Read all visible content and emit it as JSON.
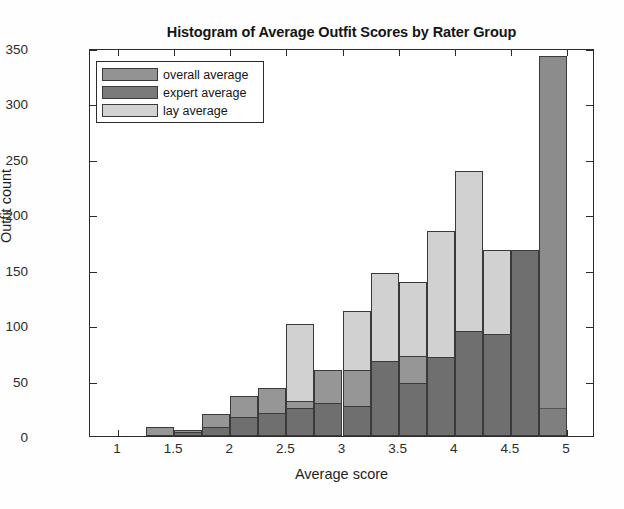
{
  "chart_data": {
    "type": "bar",
    "title": "Histogram of Average Outfit Scores by Rater Group",
    "xlabel": "Average score",
    "ylabel": "Outfit count",
    "xlim": [
      0.75,
      5.25
    ],
    "ylim": [
      0,
      350
    ],
    "ytick_labels": [
      "0",
      "50",
      "100",
      "150",
      "200",
      "250",
      "300",
      "350"
    ],
    "ytick_values": [
      0,
      50,
      100,
      150,
      200,
      250,
      300,
      350
    ],
    "xtick_labels": [
      "1",
      "1.5",
      "2",
      "2.5",
      "3",
      "3.5",
      "4",
      "4.5",
      "5"
    ],
    "xtick_values": [
      1,
      1.5,
      2,
      2.5,
      3,
      3.5,
      4,
      4.5,
      5
    ],
    "grid": false,
    "bin_width": 0.25,
    "bin_centers": [
      1.125,
      1.375,
      1.625,
      1.875,
      2.125,
      2.375,
      2.625,
      2.875,
      3.125,
      3.375,
      3.625,
      3.875,
      4.125,
      4.375,
      4.625,
      4.875
    ],
    "legend_position": "top-left",
    "series": [
      {
        "name": "overall average",
        "color": "#808080",
        "values": [
          0,
          8,
          5,
          20,
          36,
          43,
          32,
          60,
          60,
          68,
          72,
          71,
          95,
          92,
          168,
          0
        ]
      },
      {
        "name": "expert average",
        "color": "#5f5f5f",
        "values": [
          0,
          0,
          4,
          8,
          17,
          21,
          25,
          30,
          27,
          68,
          48,
          71,
          95,
          92,
          168,
          343
        ]
      },
      {
        "name": "lay average",
        "color": "#c4c4c4",
        "values": [
          0,
          8,
          5,
          20,
          36,
          43,
          101,
          60,
          113,
          147,
          139,
          185,
          239,
          168,
          168,
          25
        ]
      }
    ]
  },
  "legend": {
    "items": [
      {
        "label": "overall average",
        "swatch": "overall"
      },
      {
        "label": "expert average",
        "swatch": "expert"
      },
      {
        "label": "lay average",
        "swatch": "lay"
      }
    ]
  }
}
